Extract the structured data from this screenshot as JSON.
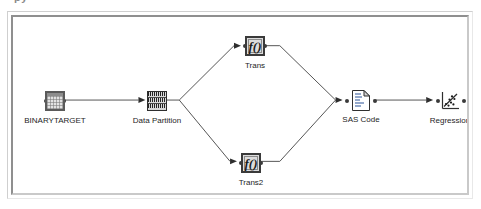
{
  "window": {
    "clipped_header_text": "py",
    "frame_border_color": "#8f8f8f",
    "canvas_background": "#ffffff"
  },
  "diagram": {
    "line_color": "#555555",
    "node_border_color": "#3a3a3a",
    "nodes": [
      {
        "id": "binarytarget",
        "label": "BINARYTARGET",
        "icon": "data-table-icon",
        "x": 47,
        "y": 94
      },
      {
        "id": "data-partition",
        "label": "Data Partition",
        "icon": "data-partition-icon",
        "x": 147,
        "y": 94
      },
      {
        "id": "trans",
        "label": "Trans",
        "icon": "transform-function-icon",
        "glyph": "f()",
        "x": 243,
        "y": 36
      },
      {
        "id": "trans2",
        "label": "Trans2",
        "icon": "transform-function-icon",
        "glyph": "f()",
        "x": 239,
        "y": 158
      },
      {
        "id": "sas-code",
        "label": "SAS Code",
        "icon": "document-code-icon",
        "x": 354,
        "y": 94
      },
      {
        "id": "regression",
        "label": "Regression",
        "icon": "scatter-regression-icon",
        "x": 440,
        "y": 95
      }
    ],
    "connections": [
      {
        "from": "binarytarget",
        "to": "data-partition"
      },
      {
        "from": "data-partition",
        "to": "trans"
      },
      {
        "from": "data-partition",
        "to": "trans2"
      },
      {
        "from": "trans",
        "to": "sas-code"
      },
      {
        "from": "trans2",
        "to": "sas-code"
      },
      {
        "from": "sas-code",
        "to": "regression"
      }
    ]
  }
}
